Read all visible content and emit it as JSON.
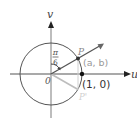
{
  "diagram": {
    "title": "",
    "axes": {
      "horizontal_label": "u",
      "vertical_label": "v",
      "origin_label": "0"
    },
    "unit_circle": {
      "radius": 1
    },
    "angle": {
      "label_numerator": "π",
      "label_denominator": "6",
      "radians": 0.5236
    },
    "points": {
      "p": {
        "label": "P",
        "coords_label": "(a, b)"
      },
      "one_zero": {
        "label": "(1, 0)"
      },
      "p_prime": {
        "label": "P'"
      }
    },
    "colors": {
      "axis": "#9a9a9a",
      "circle": "#555555",
      "ray": "#555555",
      "reflection": "#bdbdbd",
      "dark_text": "#333333",
      "gray_text": "#999999",
      "light_text": "#c8c8c8",
      "point": "#222222"
    }
  }
}
